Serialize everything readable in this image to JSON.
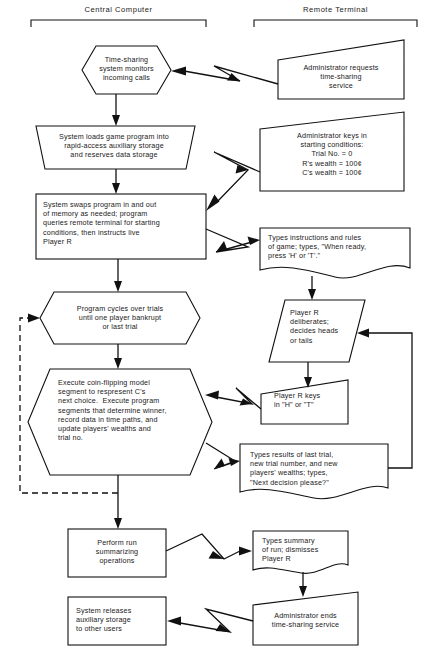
{
  "diagram": {
    "title_left": "Central Computer",
    "title_right": "Remote Terminal",
    "stroke_color": "#111111",
    "fill_color": "#ffffff",
    "background": "#ffffff"
  },
  "nodes": {
    "n1": {
      "shape": "hexagon",
      "column": "left",
      "text": "Time-sharing\nsystem monitors\nincoming calls"
    },
    "n2": {
      "shape": "trapezoid",
      "column": "left",
      "text": "System loads game program into\nrapid-access auxiliary storage\nand reserves data storage"
    },
    "n3": {
      "shape": "rectangle",
      "column": "left",
      "text": "System swaps program in and out\nof memory as needed; program\nqueries remote terminal for starting\nconditions, then instructs live\nPlayer R"
    },
    "n4": {
      "shape": "hexagon",
      "column": "left",
      "text": "Program cycles over trials\nuntil one player bankrupt\nor last trial"
    },
    "n5": {
      "shape": "hexagon",
      "column": "left",
      "text": "Execute coin-flipping model\nsegment to respresent C's\nnext choice.  Execute program\nsegments that determine winner,\nrecord data in time paths, and\nupdate players' wealths and\ntrial no."
    },
    "n6": {
      "shape": "rectangle",
      "column": "left",
      "text": "Perform run\nsummarizing\noperations"
    },
    "n7": {
      "shape": "rectangle",
      "column": "left",
      "text": "System releases\nauxiliary storage\nto other users"
    },
    "r1": {
      "shape": "manual-input",
      "column": "right",
      "text": "Administrator requests\ntime-sharing\nservice"
    },
    "r2": {
      "shape": "manual-input",
      "column": "right",
      "text": "Administrator keys in\nstarting conditions:\nTrial No. = 0\nR's wealth = 100¢\nC's wealth = 100¢"
    },
    "r3": {
      "shape": "document",
      "column": "right",
      "text": "Types instructions and rules\nof game; types, \"When ready,\npress 'H' or 'T'.\""
    },
    "r4": {
      "shape": "parallelogram",
      "column": "right",
      "text": "Player R\ndeliberates;\ndecides heads\nor tails"
    },
    "r5": {
      "shape": "manual-input",
      "column": "right",
      "text": "Player R keys\nin \"H\" or \"T\""
    },
    "r6": {
      "shape": "document",
      "column": "right",
      "text": "Types results of last trial,\nnew trial number, and new\nplayers' wealths; types,\n\"Next decision please?\""
    },
    "r7": {
      "shape": "document",
      "column": "right",
      "text": "Types summary\nof run; dismisses\nPlayer R"
    },
    "r8": {
      "shape": "manual-input",
      "column": "right",
      "text": "Administrator ends\ntime-sharing service"
    }
  },
  "connectors": [
    {
      "name": "link-r1-to-n1",
      "type": "telecom-link",
      "direction": "right-to-left"
    },
    {
      "name": "arrow-n1-to-n2",
      "type": "solid-arrow",
      "direction": "down"
    },
    {
      "name": "arrow-n2-to-n3",
      "type": "solid-arrow",
      "direction": "down"
    },
    {
      "name": "link-r2-to-n3",
      "type": "telecom-link",
      "direction": "right-to-left"
    },
    {
      "name": "link-n3-to-r3",
      "type": "telecom-link",
      "direction": "left-to-right"
    },
    {
      "name": "arrow-n3-to-n4",
      "type": "solid-arrow",
      "direction": "down"
    },
    {
      "name": "arrow-r3-to-r4",
      "type": "solid-arrow",
      "direction": "down"
    },
    {
      "name": "arrow-n4-to-n5",
      "type": "solid-arrow",
      "direction": "down"
    },
    {
      "name": "arrow-r4-to-r5",
      "type": "solid-arrow",
      "direction": "down"
    },
    {
      "name": "link-r5-to-n5",
      "type": "telecom-link",
      "direction": "right-to-left"
    },
    {
      "name": "link-n5-to-r6",
      "type": "telecom-link",
      "direction": "left-to-right"
    },
    {
      "name": "loop-n5-to-n4",
      "type": "dashed-feedback",
      "direction": "up-left"
    },
    {
      "name": "loop-r6-to-r4",
      "type": "solid-feedback",
      "direction": "up-right"
    },
    {
      "name": "arrow-n5-to-n6",
      "type": "solid-arrow",
      "direction": "down"
    },
    {
      "name": "link-n6-to-r7",
      "type": "telecom-link",
      "direction": "left-to-right"
    },
    {
      "name": "arrow-r7-to-r8",
      "type": "solid-arrow",
      "direction": "down"
    },
    {
      "name": "link-r8-to-n7",
      "type": "telecom-link",
      "direction": "right-to-left"
    }
  ]
}
